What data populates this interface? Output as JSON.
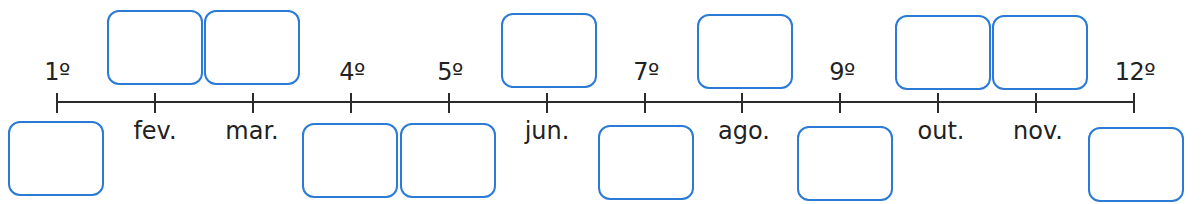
{
  "timeline": {
    "ticks_x": [
      57,
      154.9,
      252.8,
      350.7,
      448.6,
      546.5,
      644.5,
      742.4,
      840.3,
      938.2,
      1036.1,
      1134
    ],
    "ordinal_labels": [
      {
        "text": "1º",
        "x": 57
      },
      {
        "text": "4º",
        "x": 352
      },
      {
        "text": "5º",
        "x": 450
      },
      {
        "text": "7º",
        "x": 646
      },
      {
        "text": "9º",
        "x": 842
      },
      {
        "text": "12º",
        "x": 1135
      }
    ],
    "month_labels": [
      {
        "text": "fev.",
        "x": 155
      },
      {
        "text": "mar.",
        "x": 252
      },
      {
        "text": "jun.",
        "x": 547
      },
      {
        "text": "ago.",
        "x": 744
      },
      {
        "text": "out.",
        "x": 941
      },
      {
        "text": "nov.",
        "x": 1038
      }
    ],
    "answer_boxes": [
      {
        "position": "bottom",
        "slot": "1º",
        "x": 8,
        "y": 121
      },
      {
        "position": "top",
        "slot": "fev.",
        "x": 107,
        "y": 10
      },
      {
        "position": "top",
        "slot": "mar.",
        "x": 204,
        "y": 10
      },
      {
        "position": "bottom",
        "slot": "4º",
        "x": 302,
        "y": 123
      },
      {
        "position": "bottom",
        "slot": "5º",
        "x": 400,
        "y": 123
      },
      {
        "position": "top",
        "slot": "jun.",
        "x": 501,
        "y": 13
      },
      {
        "position": "bottom",
        "slot": "7º",
        "x": 598,
        "y": 125
      },
      {
        "position": "top",
        "slot": "ago.",
        "x": 697,
        "y": 14
      },
      {
        "position": "bottom",
        "slot": "9º",
        "x": 797,
        "y": 126
      },
      {
        "position": "top",
        "slot": "out.",
        "x": 895,
        "y": 15
      },
      {
        "position": "top",
        "slot": "nov.",
        "x": 992,
        "y": 15
      },
      {
        "position": "bottom",
        "slot": "12º",
        "x": 1088,
        "y": 127
      }
    ]
  },
  "colors": {
    "box_border": "#2a7ad6",
    "line": "#2b2b2b",
    "text": "#222222"
  }
}
